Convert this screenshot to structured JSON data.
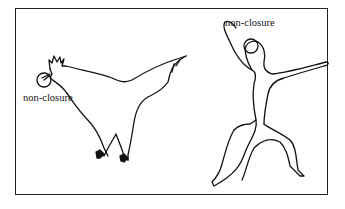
{
  "figure": {
    "labels": {
      "bird": "non-closure",
      "human": "non-closure"
    },
    "shapes": [
      "rooster-outline",
      "human-figure-outline"
    ],
    "colors": {
      "stroke": "#111111",
      "background": "#ffffff",
      "frame": "#222222"
    }
  }
}
